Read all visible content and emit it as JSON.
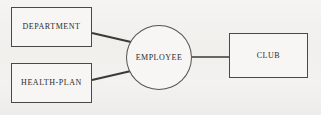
{
  "diagram": {
    "type": "entity-relationship",
    "background_color": "#f3f1ef",
    "stroke_color": "#4a4946",
    "text_color": "#2b2a28",
    "width": 321,
    "height": 115,
    "entities": [
      {
        "id": "department",
        "label": "DEPARTMENT",
        "shape": "rectangle",
        "x": 11,
        "y": 7,
        "width": 81,
        "height": 40
      },
      {
        "id": "health-plan",
        "label": "HEALTH-PLAN",
        "shape": "rectangle",
        "x": 11,
        "y": 63,
        "width": 81,
        "height": 40
      },
      {
        "id": "club",
        "label": "CLUB",
        "shape": "rectangle",
        "x": 229,
        "y": 33,
        "width": 79,
        "height": 45
      }
    ],
    "relationships": [
      {
        "id": "employee",
        "label": "EMPLOYEE",
        "shape": "ellipse",
        "cx": 159,
        "cy": 57.5,
        "rx": 33,
        "ry": 32.5
      }
    ],
    "connectors": [
      {
        "id": "department-employee",
        "from": "department",
        "to": "employee",
        "x1": 92,
        "y1": 33,
        "x2": 131,
        "y2": 42,
        "thickness": 2.2
      },
      {
        "id": "health-plan-employee",
        "from": "health-plan",
        "to": "employee",
        "x1": 92,
        "y1": 80,
        "x2": 131,
        "y2": 71,
        "thickness": 2.2
      },
      {
        "id": "employee-club",
        "from": "employee",
        "to": "club",
        "x1": 192,
        "y1": 57,
        "x2": 229,
        "y2": 57,
        "thickness": 1.6
      }
    ]
  }
}
